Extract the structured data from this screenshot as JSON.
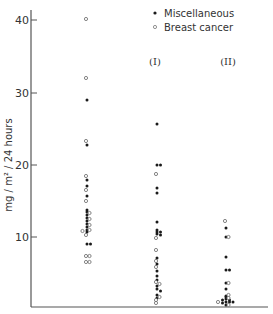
{
  "chart_data": {
    "type": "scatter",
    "title": "",
    "xlabel": "",
    "ylabel": "mg / m² / 24 hours",
    "ylim": [
      0,
      42
    ],
    "yticks": [
      10,
      20,
      30,
      40
    ],
    "grid": false,
    "legend_position": "top-right",
    "legend": [
      {
        "name": "Miscellaneous",
        "marker": "filled-circle"
      },
      {
        "name": "Breast cancer",
        "marker": "open-circle"
      }
    ],
    "groups": [
      {
        "label": "",
        "x_index": 0
      },
      {
        "label": "(I)",
        "x_index": 1
      },
      {
        "label": "(II)",
        "x_index": 2
      }
    ],
    "series": [
      {
        "name": "Miscellaneous",
        "points": [
          [
            0,
            29.0
          ],
          [
            0,
            22.7
          ],
          [
            0,
            17.8
          ],
          [
            0,
            17.0
          ],
          [
            0,
            15.6
          ],
          [
            0,
            13.7
          ],
          [
            0,
            13.5
          ],
          [
            0,
            13.0
          ],
          [
            0,
            12.6
          ],
          [
            0,
            12.2
          ],
          [
            0,
            11.8
          ],
          [
            0,
            11.4
          ],
          [
            0,
            11.0
          ],
          [
            0,
            10.6
          ],
          [
            0,
            9.0
          ],
          [
            0,
            9.0
          ],
          [
            1,
            25.6
          ],
          [
            1,
            20.0
          ],
          [
            1,
            20.0
          ],
          [
            1,
            16.8
          ],
          [
            1,
            16.0
          ],
          [
            1,
            12.0
          ],
          [
            1,
            11.0
          ],
          [
            1,
            10.6
          ],
          [
            1,
            10.6
          ],
          [
            1,
            10.4
          ],
          [
            1,
            10.3
          ],
          [
            1,
            7.0
          ],
          [
            1,
            6.2
          ],
          [
            1,
            5.3
          ],
          [
            1,
            4.6
          ],
          [
            1,
            4.0
          ],
          [
            1,
            3.2
          ],
          [
            1,
            2.8
          ],
          [
            1,
            2.5
          ],
          [
            1,
            2.0
          ],
          [
            1,
            1.5
          ],
          [
            2,
            11.2
          ],
          [
            2,
            10.0
          ],
          [
            2,
            7.2
          ],
          [
            2,
            5.4
          ],
          [
            2,
            5.4
          ],
          [
            2,
            3.6
          ],
          [
            2,
            2.8
          ],
          [
            2,
            1.8
          ],
          [
            2,
            1.6
          ],
          [
            2,
            1.4
          ],
          [
            2,
            1.2
          ],
          [
            2,
            1.0
          ],
          [
            2,
            1.0
          ],
          [
            2,
            0.8
          ],
          [
            2,
            0.6
          ],
          [
            2,
            1.2
          ],
          [
            2,
            1.0
          ]
        ]
      },
      {
        "name": "Breast cancer",
        "points": [
          [
            0,
            40.2
          ],
          [
            0,
            32.0
          ],
          [
            0,
            23.3
          ],
          [
            0,
            18.4
          ],
          [
            0,
            16.5
          ],
          [
            0,
            15.0
          ],
          [
            0,
            13.3
          ],
          [
            0,
            12.4
          ],
          [
            0,
            11.6
          ],
          [
            0,
            11.0
          ],
          [
            0,
            10.8
          ],
          [
            0,
            10.2
          ],
          [
            0,
            7.3
          ],
          [
            0,
            7.3
          ],
          [
            0,
            6.5
          ],
          [
            0,
            6.5
          ],
          [
            1,
            18.7
          ],
          [
            1,
            9.8
          ],
          [
            1,
            8.2
          ],
          [
            1,
            6.6
          ],
          [
            1,
            5.8
          ],
          [
            1,
            3.8
          ],
          [
            1,
            3.5
          ],
          [
            1,
            1.6
          ],
          [
            1,
            1.2
          ],
          [
            1,
            0.8
          ],
          [
            2,
            12.2
          ],
          [
            2,
            10.0
          ],
          [
            2,
            3.6
          ],
          [
            2,
            2.0
          ],
          [
            2,
            1.5
          ],
          [
            2,
            1.0
          ],
          [
            2,
            0.6
          ]
        ]
      }
    ]
  },
  "labels": {
    "y_axis_title": "mg / m² / 24 hours",
    "legend_misc": "Miscellaneous",
    "legend_breast": "Breast cancer",
    "group_1": "(I)",
    "group_2": "(II)",
    "tick_10": "10",
    "tick_20": "20",
    "tick_30": "30",
    "tick_40": "40"
  },
  "colors": {
    "axis": "#555555",
    "marker_filled": "#1a1a1a",
    "marker_open_stroke": "#666666"
  }
}
